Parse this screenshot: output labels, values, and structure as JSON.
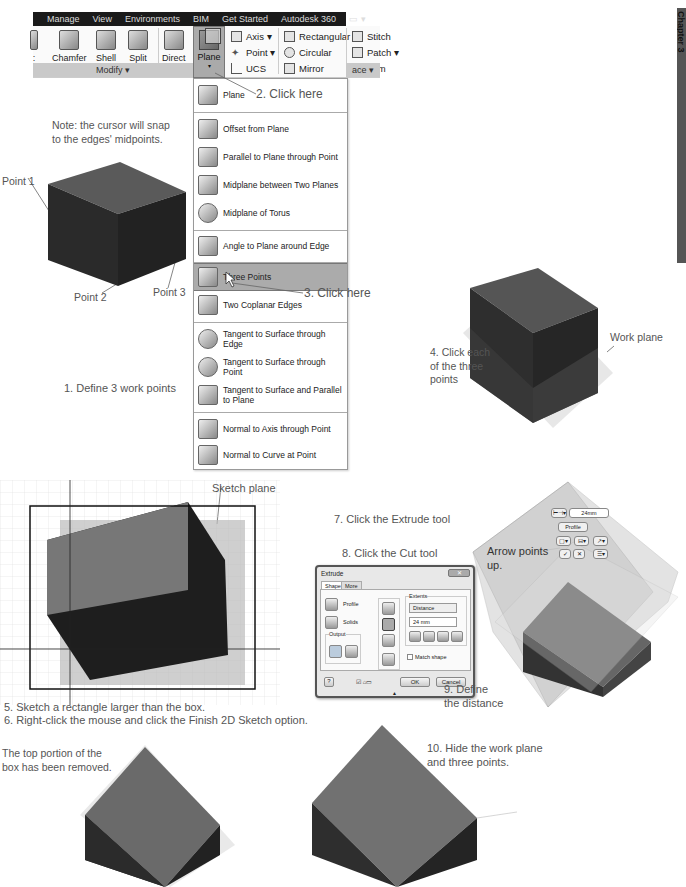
{
  "ribbon": {
    "tabs": [
      "Manage",
      "View",
      "Environments",
      "BIM",
      "Get Started",
      "Autodesk 360",
      "▭ ▾"
    ],
    "modify_buttons": [
      {
        "label": ":",
        "icon": "partial-tool-icon"
      },
      {
        "label": "Chamfer",
        "icon": "chamfer-icon"
      },
      {
        "label": "Shell",
        "icon": "shell-icon"
      },
      {
        "label": "Split",
        "icon": "split-icon"
      },
      {
        "label": "Direct",
        "icon": "direct-edit-icon"
      }
    ],
    "plane_button": {
      "label": "Plane",
      "icon": "plane-icon"
    },
    "work_features": [
      {
        "label": "Axis ▾",
        "icon": "axis-icon"
      },
      {
        "label": "Point ▾",
        "icon": "point-icon"
      },
      {
        "label": "UCS",
        "icon": "ucs-icon"
      }
    ],
    "pattern": [
      {
        "label": "Rectangular",
        "icon": "rectangular-pattern-icon"
      },
      {
        "label": "Circular",
        "icon": "circular-pattern-icon"
      },
      {
        "label": "Mirror",
        "icon": "mirror-icon"
      }
    ],
    "surface": [
      {
        "label": "Stitch",
        "icon": "stitch-icon"
      },
      {
        "label": "Patch ▾",
        "icon": "patch-icon"
      },
      {
        "label": "Trim",
        "icon": "trim-icon"
      }
    ],
    "modify_panel_label": "Modify ▾",
    "surface_panel_label": "ace ▾"
  },
  "plane_menu": {
    "items": [
      {
        "label": "Plane",
        "icon": "plane-icon"
      },
      {
        "label": "Offset from Plane",
        "icon": "offset-plane-icon"
      },
      {
        "label": "Parallel to Plane through Point",
        "icon": "parallel-plane-icon"
      },
      {
        "label": "Midplane between Two Planes",
        "icon": "midplane-icon"
      },
      {
        "label": "Midplane of Torus",
        "icon": "torus-icon"
      },
      {
        "label": "Angle to Plane around Edge",
        "icon": "angle-plane-icon"
      },
      {
        "label": "Three Points",
        "icon": "three-points-icon",
        "selected": true
      },
      {
        "label": "Two Coplanar Edges",
        "icon": "coplanar-edges-icon"
      },
      {
        "label": "Tangent to Surface through Edge",
        "icon": "tangent-edge-icon"
      },
      {
        "label": "Tangent to Surface through Point",
        "icon": "tangent-point-icon"
      },
      {
        "label": "Tangent to Surface and Parallel to Plane",
        "icon": "tangent-parallel-icon"
      },
      {
        "label": "Normal to Axis through Point",
        "icon": "normal-axis-icon"
      },
      {
        "label": "Normal to Curve at Point",
        "icon": "normal-curve-icon"
      }
    ]
  },
  "chapter_tab": "Chapter 3",
  "callouts": {
    "step2": "2. Click here",
    "step3": "3. Click here",
    "note": "Note: the cursor will snap\nto the edges' midpoints.",
    "point1": "Point 1",
    "point2": "Point 2",
    "point3": "Point 3",
    "step1": "1. Define 3 work points",
    "step4": "4. Click each\nof the three\npoints",
    "work_plane": "Work plane",
    "sketch_plane": "Sketch plane",
    "step5": "5. Sketch a rectangle larger than the box.",
    "step6": "6. Right-click the mouse and click the Finish 2D Sketch option.",
    "step7": "7. Click the Extrude tool",
    "step8": "8. Click the Cut tool",
    "step9": "9. Define\nthe distance",
    "arrow_up": "Arrow points\nup.",
    "removed": "The top portion of the\nbox has been removed.",
    "step10": "10. Hide the work plane\nand three points."
  },
  "extrude_dialog": {
    "title": "Extrude",
    "close": "✕",
    "tabs": [
      "Shape",
      "More"
    ],
    "profile_label": "Profile",
    "solids_label": "Solids",
    "output_label": "Output",
    "extents_label": "Extents",
    "extents_value": "Distance",
    "distance_value": "24 mm",
    "match_shape_label": "Match shape",
    "ok_label": "OK",
    "cancel_label": "Cancel",
    "help_label": "?"
  },
  "mini_toolbar": {
    "profile_label": "Profile",
    "distance_value": "24mm"
  }
}
